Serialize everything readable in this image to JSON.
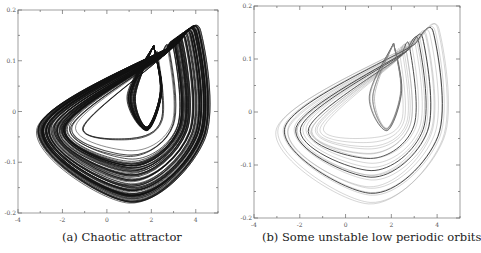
{
  "chart_data": [
    {
      "type": "line",
      "title": "",
      "caption": "(a) Chaotic attractor",
      "xlabel": "",
      "ylabel": "",
      "xlim": [
        -4,
        5
      ],
      "ylim": [
        -0.2,
        0.2
      ],
      "xticks": [
        -4,
        -2,
        0,
        2,
        4
      ],
      "xtick_labels": [
        "-4",
        "-2",
        "0",
        "2",
        "4"
      ],
      "yticks": [
        -0.2,
        -0.1,
        0,
        0.1,
        0.2
      ],
      "ytick_labels": [
        "-0.2",
        "-0.1",
        "0",
        "0.1",
        "0.2"
      ],
      "grid": false,
      "style": "dense",
      "line_color": "#111111",
      "description": "Dense chaotic attractor with outer lobe from x≈-3.2 to x≈4.6 and inner loop near x≈1.8, y≈0",
      "series": [
        {
          "name": "trajectory",
          "x_extent": [
            -3.2,
            4.6
          ],
          "y_extent": [
            -0.18,
            0.165
          ]
        }
      ]
    },
    {
      "type": "line",
      "title": "",
      "caption": "(b) Some unstable low periodic orbits",
      "xlabel": "",
      "ylabel": "",
      "xlim": [
        -4,
        5
      ],
      "ylim": [
        -0.2,
        0.2
      ],
      "xticks": [
        -4,
        -2,
        0,
        2,
        4
      ],
      "xtick_labels": [
        "-4",
        "-2",
        "0",
        "2",
        "4"
      ],
      "yticks": [
        -0.2,
        -0.1,
        0,
        0.1,
        0.2
      ],
      "ytick_labels": [
        "-0.2",
        "-0.1",
        "0",
        "0.1",
        "0.2"
      ],
      "grid": false,
      "style": "sparse",
      "line_color": "#444444",
      "description": "Several unstable periodic orbits embedded in the attractor, drawn as thin gray curves with a few darker highlighted orbits",
      "series": [
        {
          "name": "orbits",
          "x_extent": [
            -3.2,
            4.4
          ],
          "y_extent": [
            -0.18,
            0.165
          ]
        }
      ]
    }
  ]
}
